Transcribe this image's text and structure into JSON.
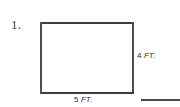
{
  "page": {
    "background_color": "#ffffff",
    "ink_color": "#3d3d3d"
  },
  "problem": {
    "number_label": "1.",
    "figure": {
      "shape": "rectangle",
      "width_label": "5",
      "width_unit": " FT.",
      "width_full": "5 FT.",
      "height_label": "4",
      "height_unit": " FT.",
      "height_full": "4 FT."
    },
    "answer_blank": {
      "value": ""
    }
  }
}
